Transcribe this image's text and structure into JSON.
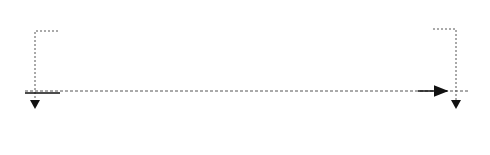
{
  "diagram": {
    "type": "undulator magnet array",
    "colors": {
      "north_fill": "#ffffff",
      "south_fill": "#dcdcdc",
      "stroke": "#333333",
      "line": "#111111",
      "dashed": "#555555"
    },
    "top_row": {
      "labels": [
        "N",
        "S",
        "N",
        "S",
        "N",
        "S",
        "N",
        "S",
        "N",
        "S",
        "N"
      ]
    },
    "bottom_row": {
      "labels": [
        "S",
        "N",
        "S",
        "N",
        "S",
        "N",
        "S",
        "N",
        "S",
        "N",
        "S"
      ]
    },
    "magnet_x": [
      [
        66,
        79
      ],
      [
        89,
        115
      ],
      [
        124,
        150
      ],
      [
        159,
        185
      ],
      [
        194,
        220
      ],
      [
        229,
        255
      ],
      [
        264,
        290
      ],
      [
        299,
        325
      ],
      [
        334,
        360
      ],
      [
        369,
        395
      ],
      [
        407,
        420
      ]
    ],
    "markers": [
      {
        "x": 59,
        "y": 93
      },
      {
        "x": 175,
        "y": 118
      },
      {
        "x": 287,
        "y": 94
      },
      {
        "x": 393,
        "y": 114
      }
    ]
  }
}
